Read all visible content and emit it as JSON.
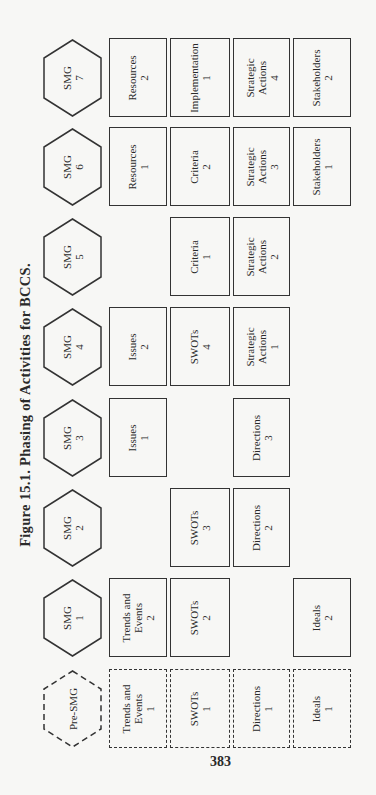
{
  "figure": {
    "title": "Figure 15.1. Phasing of Activities for BCCS.",
    "page_number": "383"
  },
  "rows": [
    {
      "phase": "SMG 7",
      "phase_line1": "SMG",
      "phase_line2": "7",
      "style": "solid",
      "cells": [
        {
          "col": 1,
          "line1": "Resources",
          "line2": "2"
        },
        {
          "col": 2,
          "line1": "Implementation",
          "line2": "1"
        },
        {
          "col": 3,
          "line1": "Strategic",
          "line2": "Actions",
          "line3": "4"
        },
        {
          "col": 4,
          "line1": "Stakeholders",
          "line2": "2"
        }
      ]
    },
    {
      "phase": "SMG 6",
      "phase_line1": "SMG",
      "phase_line2": "6",
      "style": "solid",
      "cells": [
        {
          "col": 1,
          "line1": "Resources",
          "line2": "1"
        },
        {
          "col": 2,
          "line1": "Criteria",
          "line2": "2"
        },
        {
          "col": 3,
          "line1": "Strategic",
          "line2": "Actions",
          "line3": "3"
        },
        {
          "col": 4,
          "line1": "Stakeholders",
          "line2": "1"
        }
      ]
    },
    {
      "phase": "SMG 5",
      "phase_line1": "SMG",
      "phase_line2": "5",
      "style": "solid",
      "cells": [
        {
          "col": 2,
          "line1": "Criteria",
          "line2": "1"
        },
        {
          "col": 3,
          "line1": "Strategic",
          "line2": "Actions",
          "line3": "2"
        }
      ]
    },
    {
      "phase": "SMG 4",
      "phase_line1": "SMG",
      "phase_line2": "4",
      "style": "solid",
      "cells": [
        {
          "col": 1,
          "line1": "Issues",
          "line2": "2"
        },
        {
          "col": 2,
          "line1": "SWOTs",
          "line2": "4"
        },
        {
          "col": 3,
          "line1": "Strategic",
          "line2": "Actions",
          "line3": "1"
        }
      ]
    },
    {
      "phase": "SMG 3",
      "phase_line1": "SMG",
      "phase_line2": "3",
      "style": "solid",
      "cells": [
        {
          "col": 1,
          "line1": "Issues",
          "line2": "1"
        },
        {
          "col": 3,
          "line1": "Directions",
          "line2": "3"
        }
      ]
    },
    {
      "phase": "SMG 2",
      "phase_line1": "SMG",
      "phase_line2": "2",
      "style": "solid",
      "cells": [
        {
          "col": 2,
          "line1": "SWOTs",
          "line2": "3"
        },
        {
          "col": 3,
          "line1": "Directions",
          "line2": "2"
        }
      ]
    },
    {
      "phase": "SMG 1",
      "phase_line1": "SMG",
      "phase_line2": "1",
      "style": "solid",
      "cells": [
        {
          "col": 1,
          "line1": "Trends and",
          "line2": "Events",
          "line3": "2"
        },
        {
          "col": 2,
          "line1": "SWOTs",
          "line2": "2"
        },
        {
          "col": 4,
          "line1": "Ideals",
          "line2": "2"
        }
      ]
    },
    {
      "phase": "Pre-SMG",
      "phase_line1": "Pre-SMG",
      "phase_line2": "",
      "style": "dashed",
      "cells": [
        {
          "col": 1,
          "line1": "Trends and",
          "line2": "Events",
          "line3": "1"
        },
        {
          "col": 2,
          "line1": "SWOTs",
          "line2": "1"
        },
        {
          "col": 3,
          "line1": "Directions",
          "line2": "1"
        },
        {
          "col": 4,
          "line1": "Ideals",
          "line2": "1"
        }
      ]
    }
  ]
}
